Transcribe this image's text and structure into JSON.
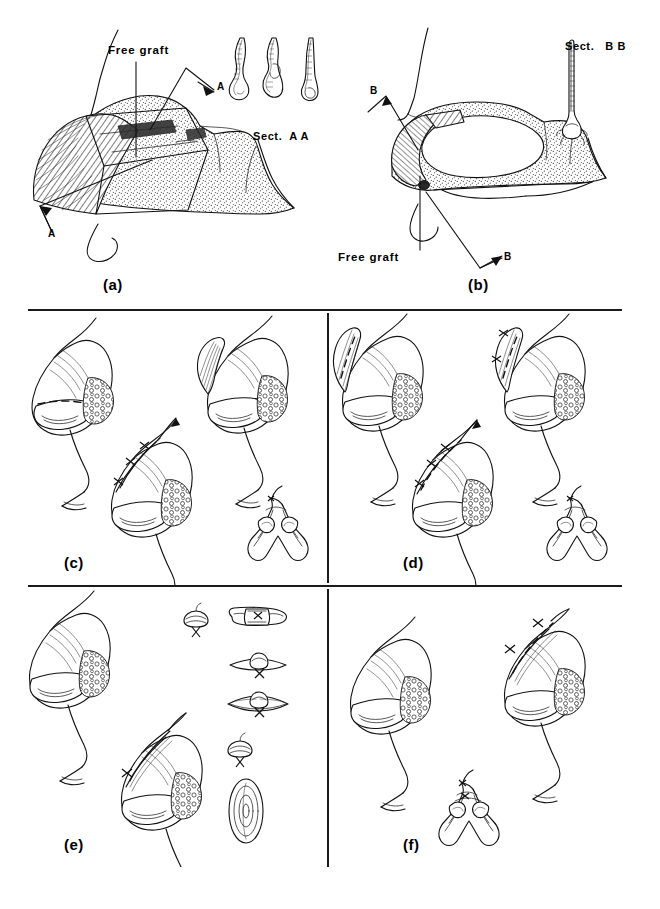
{
  "figure": {
    "kind": "surgical-technique-illustration",
    "style": "black-and-white line art",
    "width": 660,
    "height": 909,
    "background_color": "#ffffff",
    "ink_color": "#111111"
  },
  "panels": [
    {
      "id": "a",
      "label": "(a)",
      "label_x": 103,
      "label_y": 278,
      "annotations": [
        {
          "name": "free-graft",
          "text": "Free graft",
          "x": 108,
          "y": 52
        },
        {
          "name": "section-arrow-upper",
          "text": "A",
          "x": 187,
          "y": 92
        },
        {
          "name": "section-arrow-lower",
          "text": "A",
          "x": 47,
          "y": 228
        }
      ],
      "inset": {
        "name": "section-aa",
        "label": "Sect.  A A",
        "label_x": 253,
        "label_y": 133,
        "count": 3,
        "description": "three cross-section strips of alar rim with graft"
      }
    },
    {
      "id": "b",
      "label": "(b)",
      "label_x": 468,
      "label_y": 278,
      "annotations": [
        {
          "name": "free-graft",
          "text": "Free graft",
          "x": 338,
          "y": 253
        },
        {
          "name": "section-arrow-upper",
          "text": "B",
          "x": 377,
          "y": 92
        },
        {
          "name": "section-arrow-lower",
          "text": "B",
          "x": 483,
          "y": 257
        }
      ],
      "inset": {
        "name": "section-bb",
        "label": "Sect.   B B",
        "label_x": 565,
        "label_y": 43,
        "count": 1,
        "description": "single vertical cross-section strip"
      }
    },
    {
      "id": "c",
      "label": "(c)",
      "label_x": 64,
      "label_y": 557,
      "annotations": [],
      "views": [
        "profile with dashed incision line",
        "profile with elevated flap",
        "profile with sutures",
        "base view of nose"
      ]
    },
    {
      "id": "d",
      "label": "(d)",
      "label_x": 403,
      "label_y": 557,
      "annotations": [],
      "views": [
        "profile with raised flap and dashed line",
        "profile with sutured flap",
        "profile with sutures",
        "base view of nose"
      ]
    },
    {
      "id": "e",
      "label": "(e)",
      "label_x": 64,
      "label_y": 855,
      "annotations": [],
      "views": [
        "profile intact",
        "profile with sutured graft"
      ],
      "inset": {
        "name": "suture-detail-column",
        "count": 5,
        "description": "column of suture / bolster cross-section details"
      }
    },
    {
      "id": "f",
      "label": "(f)",
      "label_x": 403,
      "label_y": 855,
      "annotations": [],
      "views": [
        "profile intact",
        "profile with sutures",
        "base view of nose"
      ]
    }
  ],
  "dividers": {
    "horizontal": [
      {
        "name": "divider-top",
        "x": 28,
        "y": 309,
        "width": 594
      },
      {
        "name": "divider-middle",
        "x": 28,
        "y": 585,
        "width": 594
      }
    ],
    "vertical": [
      {
        "name": "divider-col-upper",
        "x": 327,
        "y": 313,
        "height": 270
      },
      {
        "name": "divider-col-lower",
        "x": 327,
        "y": 589,
        "height": 278
      }
    ]
  }
}
